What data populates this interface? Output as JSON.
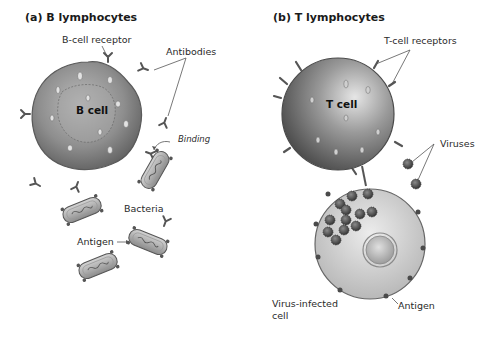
{
  "panels": {
    "a": {
      "title": "(a) B lymphocytes",
      "cell_label": "B cell",
      "labels": {
        "receptor": "B-cell receptor",
        "antibodies": "Antibodies",
        "binding": "Binding",
        "bacteria": "Bacteria",
        "antigen": "Antigen"
      }
    },
    "b": {
      "title": "(b) T lymphocytes",
      "cell_label": "T cell",
      "labels": {
        "receptors": "T-cell receptors",
        "viruses": "Viruses",
        "infected_line1": "Virus-infected",
        "infected_line2": "cell",
        "antigen": "Antigen"
      }
    }
  },
  "colors": {
    "cell_gray": "#8a8a8a",
    "cell_light": "#c8c8c8",
    "infected_cell": "#d8d8d8",
    "virus": "#4a4a4a",
    "leader_line": "#555555"
  }
}
